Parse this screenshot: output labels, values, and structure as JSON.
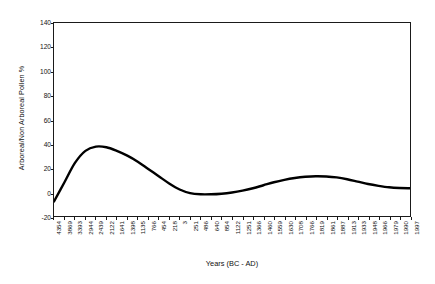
{
  "chart_data": {
    "type": "line",
    "title": "",
    "xlabel": "Years (BC - AD)",
    "ylabel": "Arboreal/Non Arboreal Pollen %",
    "ylim": [
      -20,
      140
    ],
    "yticks": [
      -20,
      0,
      20,
      40,
      60,
      80,
      100,
      120,
      140
    ],
    "ytick_labels": [
      "-20",
      "0",
      "20",
      "40",
      "60",
      "80",
      "100",
      "120",
      "140"
    ],
    "grid": false,
    "legend": null,
    "line_color": "#000000",
    "line_width": 2.4,
    "categories": [
      "4354",
      "3869",
      "3393",
      "2944",
      "2439",
      "2122",
      "1641",
      "1398",
      "1135",
      "766",
      "454",
      "218",
      "3",
      "251",
      "486",
      "640",
      "854",
      "1122",
      "1251",
      "1366",
      "1460",
      "1559",
      "1630",
      "1708",
      "1766",
      "1819",
      "1861",
      "1887",
      "1913",
      "1933",
      "1948",
      "1966",
      "1979",
      "1990",
      "1997"
    ],
    "values": [
      -8,
      8,
      24,
      34,
      37.5,
      37,
      34,
      30,
      25,
      19,
      13,
      7,
      2,
      -1,
      -2,
      -2,
      -1.5,
      -0.5,
      1,
      3,
      5.5,
      8,
      10,
      11.5,
      12.5,
      13,
      12.8,
      12,
      10.5,
      8.5,
      6.5,
      5,
      3.8,
      3.2,
      3
    ],
    "series_name": "Arboreal/Non Arboreal Pollen %"
  }
}
